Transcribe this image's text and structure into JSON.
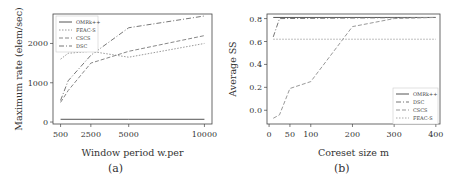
{
  "chart_data": [
    {
      "panel": "(a)",
      "type": "line",
      "xlabel": "Window period w.per",
      "ylabel": "Maximum rate (elem/sec)",
      "x": [
        500,
        2500,
        5000,
        10000
      ],
      "xticks": [
        500,
        2500,
        5000,
        10000
      ],
      "yticks": [
        0,
        1000,
        2000
      ],
      "ylim": [
        -50,
        2750
      ],
      "xlim": [
        0,
        10500
      ],
      "legend_position": "upper left",
      "series": [
        {
          "name": "OMRk++",
          "style": "solid",
          "color": "#555555",
          "x": [
            500,
            2500,
            5000,
            10000
          ],
          "values": [
            70,
            70,
            70,
            70
          ]
        },
        {
          "name": "FEAC-S",
          "style": "dotted",
          "color": "#999999",
          "x": [
            500,
            1000,
            2500,
            5000,
            10000
          ],
          "values": [
            1600,
            1750,
            1800,
            1650,
            2000
          ]
        },
        {
          "name": "CSCS",
          "style": "dashed",
          "color": "#888888",
          "x": [
            500,
            1000,
            2500,
            5000,
            10000
          ],
          "values": [
            500,
            800,
            1500,
            1800,
            2200
          ]
        },
        {
          "name": "DSC",
          "style": "dashdot",
          "color": "#777777",
          "x": [
            500,
            1000,
            2500,
            5000,
            10000
          ],
          "values": [
            550,
            1050,
            1700,
            2400,
            2700
          ]
        }
      ]
    },
    {
      "panel": "(b)",
      "type": "line",
      "xlabel": "Coreset size m",
      "ylabel": "Average SS",
      "xticks": [
        0,
        50,
        100,
        200,
        300,
        400
      ],
      "yticks": [
        0.0,
        0.2,
        0.4,
        0.6,
        0.8
      ],
      "ylim": [
        -0.12,
        0.84
      ],
      "xlim": [
        -5,
        410
      ],
      "legend_position": "lower right",
      "series": [
        {
          "name": "OMRk++",
          "style": "solid",
          "color": "#555555",
          "x": [
            10,
            400
          ],
          "values": [
            0.81,
            0.81
          ]
        },
        {
          "name": "DSC",
          "style": "dashdot",
          "color": "#777777",
          "x": [
            10,
            25,
            400
          ],
          "values": [
            0.64,
            0.8,
            0.81
          ]
        },
        {
          "name": "CSCS",
          "style": "dashed",
          "color": "#999999",
          "x": [
            10,
            25,
            50,
            100,
            200,
            300,
            400
          ],
          "values": [
            -0.07,
            -0.04,
            0.19,
            0.25,
            0.73,
            0.8,
            0.81
          ]
        },
        {
          "name": "FEAC-S",
          "style": "dotted",
          "color": "#aaaaaa",
          "x": [
            10,
            400
          ],
          "values": [
            0.62,
            0.62
          ]
        }
      ]
    }
  ],
  "captions": {
    "a": "(a)",
    "b": "(b)"
  }
}
